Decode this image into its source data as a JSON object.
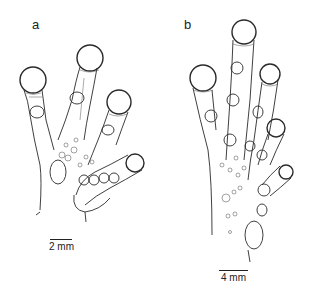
{
  "figure": {
    "panels": [
      {
        "label": "a",
        "subject": "frog-hand-palmar-view",
        "scale_bar": {
          "label": "2 mm"
        }
      },
      {
        "label": "b",
        "subject": "frog-hand-palmar-view",
        "scale_bar": {
          "label": "4 mm"
        }
      }
    ],
    "colors": {
      "line": "#2a2a2a",
      "background": "#ffffff"
    }
  }
}
